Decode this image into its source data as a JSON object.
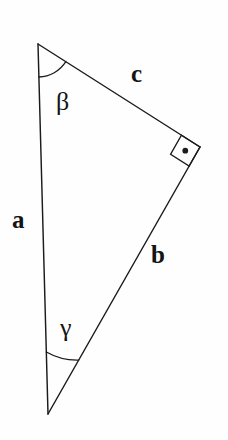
{
  "figure": {
    "kind": "geometry-diagram",
    "shape": "right-triangle",
    "background_color": "#fefefe",
    "stroke_color": "#1b1b1b",
    "text_color": "#141414"
  },
  "side_labels": {
    "a": "a",
    "b": "b",
    "c": "c"
  },
  "angle_labels": {
    "beta": "β",
    "gamma": "γ"
  },
  "markers": {
    "right_angle": "right-angle-square-with-dot"
  },
  "geometry": {
    "vertices": {
      "top": {
        "x": 38,
        "y": 44
      },
      "right": {
        "x": 200,
        "y": 147
      },
      "bottom": {
        "x": 48,
        "y": 414
      }
    },
    "edges": [
      {
        "name": "a",
        "from": "top",
        "to": "bottom"
      },
      {
        "name": "b",
        "from": "right",
        "to": "bottom"
      },
      {
        "name": "c",
        "from": "top",
        "to": "right"
      }
    ],
    "arcs": [
      {
        "name": "beta",
        "vertex": "top",
        "radius": 33
      },
      {
        "name": "gamma",
        "vertex": "bottom",
        "radius": 62
      }
    ],
    "right_angle_marker": {
      "vertex": "right",
      "size": 22
    }
  }
}
